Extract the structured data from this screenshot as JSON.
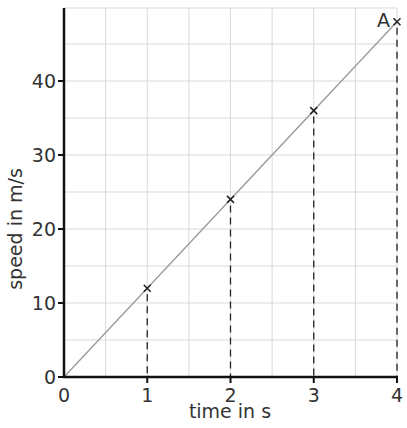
{
  "chart_data": {
    "type": "line",
    "title": "",
    "xlabel": "time in s",
    "ylabel": "speed in m/s",
    "xlim": [
      0,
      4
    ],
    "ylim": [
      0,
      49
    ],
    "x_ticks": [
      "0",
      "1",
      "2",
      "3",
      "4"
    ],
    "y_ticks": [
      "0",
      "10",
      "20",
      "30",
      "40"
    ],
    "grid": true,
    "minor_grid_step": {
      "x": 0.5,
      "y": 5
    },
    "series": [
      {
        "name": "speed",
        "x": [
          0,
          1,
          2,
          3,
          4
        ],
        "values": [
          0,
          12,
          24,
          36,
          48
        ],
        "line_color": "#999999",
        "marker": "x"
      }
    ],
    "marked_points": [
      {
        "x": 1,
        "y": 12
      },
      {
        "x": 2,
        "y": 24
      },
      {
        "x": 3,
        "y": 36
      },
      {
        "x": 4,
        "y": 48,
        "label": "A"
      }
    ],
    "dashed_droplines": [
      1,
      2,
      3,
      4
    ],
    "annotations": [
      {
        "text": "A",
        "x": 4,
        "y": 48
      }
    ],
    "legend": null
  }
}
